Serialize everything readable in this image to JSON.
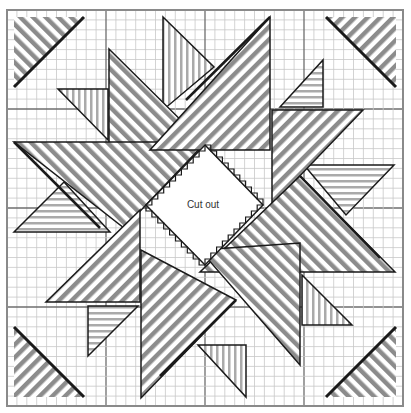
{
  "diagram": {
    "center_label": "Cut out",
    "colors": {
      "grid_minor": "#c8c8c8",
      "grid_major": "#6e6e6e",
      "outline": "#1a1a1a",
      "hatch": "#8c8c8c",
      "background": "#ffffff"
    },
    "grid": {
      "major_divisions": 4,
      "minor_per_major": 10
    },
    "pieces": [
      {
        "id": "corner-top-left",
        "hatch": "diagonal"
      },
      {
        "id": "corner-top-right",
        "hatch": "diagonal"
      },
      {
        "id": "corner-bottom-left",
        "hatch": "diagonal"
      },
      {
        "id": "corner-bottom-right",
        "hatch": "diagonal"
      },
      {
        "id": "star-point-large-1",
        "hatch": "diagonal"
      },
      {
        "id": "star-point-large-2",
        "hatch": "diagonal"
      },
      {
        "id": "star-point-large-3",
        "hatch": "diagonal"
      },
      {
        "id": "star-point-large-4",
        "hatch": "diagonal"
      },
      {
        "id": "star-point-large-5",
        "hatch": "diagonal"
      },
      {
        "id": "star-point-large-6",
        "hatch": "diagonal"
      },
      {
        "id": "star-point-large-7",
        "hatch": "diagonal"
      },
      {
        "id": "star-point-large-8",
        "hatch": "diagonal"
      },
      {
        "id": "small-triangle-1",
        "hatch": "vertical"
      },
      {
        "id": "small-triangle-2",
        "hatch": "horizontal"
      },
      {
        "id": "small-triangle-3",
        "hatch": "vertical"
      },
      {
        "id": "small-triangle-4",
        "hatch": "horizontal"
      },
      {
        "id": "small-triangle-5",
        "hatch": "vertical"
      },
      {
        "id": "small-triangle-6",
        "hatch": "horizontal"
      },
      {
        "id": "small-triangle-7",
        "hatch": "vertical"
      },
      {
        "id": "small-triangle-8",
        "hatch": "horizontal"
      }
    ]
  }
}
